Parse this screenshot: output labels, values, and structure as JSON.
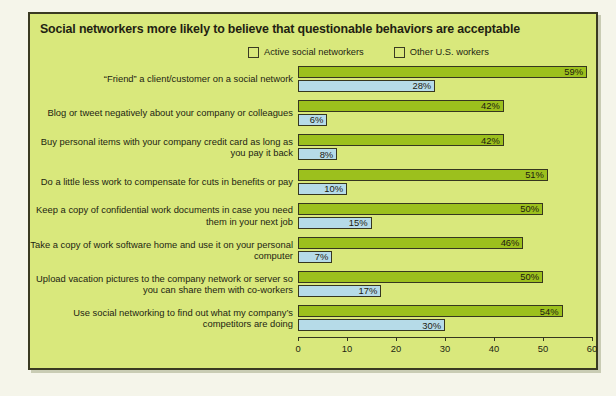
{
  "chart_data": {
    "type": "bar",
    "orientation": "horizontal",
    "title": "Social networkers more likely to believe that questionable behaviors are acceptable",
    "xlabel": "",
    "ylabel": "",
    "xlim": [
      0,
      60
    ],
    "xticks": [
      0,
      10,
      20,
      30,
      40,
      50,
      60
    ],
    "xtick_labels": [
      "0",
      "10",
      "20",
      "30",
      "40",
      "50",
      "60"
    ],
    "grid": false,
    "legend_position": "top-right",
    "value_suffix": "%",
    "categories": [
      "“Friend” a client/customer on a social network",
      "Blog or tweet negatively about your company or colleagues",
      "Buy personal items with your company credit card as long as you pay it back",
      "Do a little less work to compensate for cuts in benefits or pay",
      "Keep a copy of confidential work documents in case you need them in your next job",
      "Take a copy of work software home and use it on your personal computer",
      "Upload vacation pictures to the company network or server so you can share them with co-workers",
      "Use social networking to find out what my company’s competitors are doing"
    ],
    "series": [
      {
        "name": "Active social networkers",
        "color": "#9cc01d",
        "values": [
          59,
          42,
          42,
          51,
          50,
          46,
          50,
          54
        ],
        "labels": [
          "59%",
          "42%",
          "42%",
          "51%",
          "50%",
          "46%",
          "50%",
          "54%"
        ]
      },
      {
        "name": "Other U.S. workers",
        "color": "#b6dbe8",
        "values": [
          28,
          6,
          8,
          10,
          15,
          7,
          17,
          30
        ],
        "labels": [
          "28%",
          "6%",
          "8%",
          "10%",
          "15%",
          "7%",
          "17%",
          "30%"
        ]
      }
    ]
  },
  "colors": {
    "panel_background": "#d9e87c",
    "panel_border": "#3a3a22",
    "page_background": "#f5f5ea",
    "series_active": "#9cc01d",
    "series_other": "#b6dbe8",
    "text": "#231f12"
  }
}
